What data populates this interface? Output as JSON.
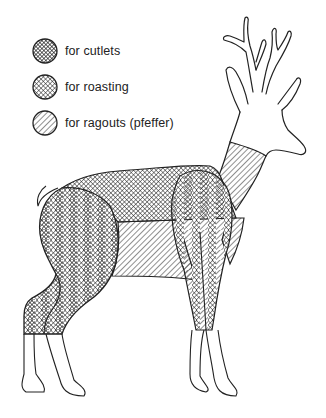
{
  "diagram": {
    "legend": [
      {
        "id": "cutlets",
        "label": "for cutlets",
        "pattern": "dense-crosshatch"
      },
      {
        "id": "roasting",
        "label": "for roasting",
        "pattern": "crosshatch"
      },
      {
        "id": "ragouts",
        "label": "for ragouts (pfeffer)",
        "pattern": "diagonal-hatch"
      }
    ],
    "regions": [
      {
        "name": "haunch",
        "cut": "cutlets"
      },
      {
        "name": "saddle",
        "cut": "roasting"
      },
      {
        "name": "shoulder",
        "cut": "roasting"
      },
      {
        "name": "neck",
        "cut": "ragouts"
      },
      {
        "name": "belly",
        "cut": "ragouts"
      },
      {
        "name": "breast",
        "cut": "ragouts"
      }
    ],
    "colors": {
      "ink": "#222222",
      "background": "#ffffff"
    }
  }
}
